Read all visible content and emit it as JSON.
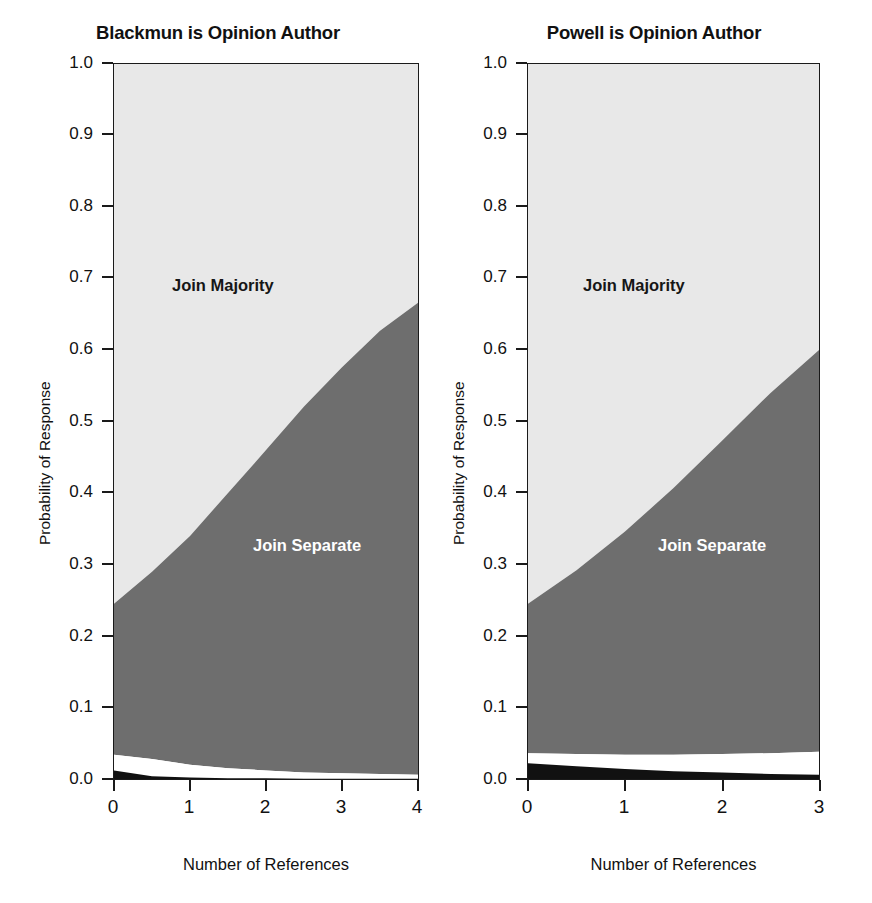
{
  "figure": {
    "background": "#ffffff",
    "panel_count": 2
  },
  "panels": [
    {
      "key": "blackmun",
      "title": "Blackmun is Opinion Author",
      "xlabel": "Number of References",
      "ylabel": "Probability of Response",
      "xticks": [
        "0",
        "1",
        "2",
        "3",
        "4"
      ],
      "yticks": [
        "0.0",
        "0.1",
        "0.2",
        "0.3",
        "0.4",
        "0.5",
        "0.6",
        "0.7",
        "0.8",
        "0.9",
        "1.0"
      ],
      "region_labels": [
        {
          "text": "Join Majority",
          "color": "#161616"
        },
        {
          "text": "Join Separate",
          "color": "#ffffff"
        }
      ]
    },
    {
      "key": "powell",
      "title": "Powell is Opinion Author",
      "xlabel": "Number of References",
      "ylabel": "Probability of Response",
      "xticks": [
        "0",
        "1",
        "2",
        "3"
      ],
      "yticks": [
        "0.0",
        "0.1",
        "0.2",
        "0.3",
        "0.4",
        "0.5",
        "0.6",
        "0.7",
        "0.8",
        "0.9",
        "1.0"
      ],
      "region_labels": [
        {
          "text": "Join Majority",
          "color": "#161616"
        },
        {
          "text": "Join Separate",
          "color": "#ffffff"
        }
      ]
    }
  ],
  "colors": {
    "join_majority": "#e8e8e8",
    "join_separate": "#6e6e6e",
    "write_separate": "#ffffff",
    "dissent": "#111111",
    "frame": "#1a1a1a"
  },
  "chart_data": [
    {
      "type": "area",
      "stacked": true,
      "title": "Blackmun is Opinion Author",
      "xlabel": "Number of References",
      "ylabel": "Probability of Response",
      "xlim": [
        0,
        4
      ],
      "ylim": [
        0,
        1
      ],
      "grid": false,
      "legend": "in-plot annotations",
      "x": [
        0,
        0.5,
        1,
        1.5,
        2,
        2.5,
        3,
        3.5,
        4
      ],
      "series": [
        {
          "name": "Dissent",
          "color": "#111111",
          "values": [
            0.012,
            0.004,
            0.002,
            0.001,
            0.001,
            0.0005,
            0.0005,
            0.0005,
            0.0005
          ]
        },
        {
          "name": "Write Separate",
          "color": "#ffffff",
          "values": [
            0.022,
            0.024,
            0.018,
            0.014,
            0.011,
            0.008,
            0.007,
            0.006,
            0.005
          ]
        },
        {
          "name": "Join Separate",
          "color": "#6e6e6e",
          "values": [
            0.211,
            0.262,
            0.32,
            0.385,
            0.448,
            0.512,
            0.568,
            0.62,
            0.66
          ]
        },
        {
          "name": "Join Majority",
          "color": "#e8e8e8",
          "values": [
            0.755,
            0.71,
            0.66,
            0.6,
            0.54,
            0.479,
            0.424,
            0.373,
            0.334
          ]
        }
      ],
      "boundaries": {
        "join_separate_top": [
          0.245,
          0.29,
          0.34,
          0.4,
          0.46,
          0.521,
          0.576,
          0.627,
          0.666
        ],
        "write_separate_top": [
          0.034,
          0.028,
          0.02,
          0.015,
          0.012,
          0.009,
          0.008,
          0.007,
          0.006
        ],
        "dissent_top": [
          0.012,
          0.004,
          0.002,
          0.001,
          0.001,
          0.0005,
          0.0005,
          0.0005,
          0.0005
        ]
      }
    },
    {
      "type": "area",
      "stacked": true,
      "title": "Powell is Opinion Author",
      "xlabel": "Number of References",
      "ylabel": "Probability of Response",
      "xlim": [
        0,
        3
      ],
      "ylim": [
        0,
        1
      ],
      "grid": false,
      "legend": "in-plot annotations",
      "x": [
        0,
        0.5,
        1,
        1.5,
        2,
        2.5,
        3
      ],
      "series": [
        {
          "name": "Dissent",
          "color": "#111111",
          "values": [
            0.022,
            0.018,
            0.014,
            0.011,
            0.009,
            0.007,
            0.006
          ]
        },
        {
          "name": "Write Separate",
          "color": "#ffffff",
          "values": [
            0.014,
            0.017,
            0.02,
            0.023,
            0.026,
            0.029,
            0.032
          ]
        },
        {
          "name": "Join Separate",
          "color": "#6e6e6e",
          "values": [
            0.209,
            0.257,
            0.312,
            0.373,
            0.438,
            0.504,
            0.562
          ]
        },
        {
          "name": "Join Majority",
          "color": "#e8e8e8",
          "values": [
            0.755,
            0.708,
            0.654,
            0.593,
            0.527,
            0.46,
            0.4
          ]
        }
      ],
      "boundaries": {
        "join_separate_top": [
          0.245,
          0.292,
          0.346,
          0.407,
          0.473,
          0.54,
          0.6
        ],
        "write_separate_top": [
          0.036,
          0.035,
          0.034,
          0.034,
          0.035,
          0.036,
          0.038
        ],
        "dissent_top": [
          0.022,
          0.018,
          0.014,
          0.011,
          0.009,
          0.007,
          0.006
        ]
      }
    }
  ]
}
